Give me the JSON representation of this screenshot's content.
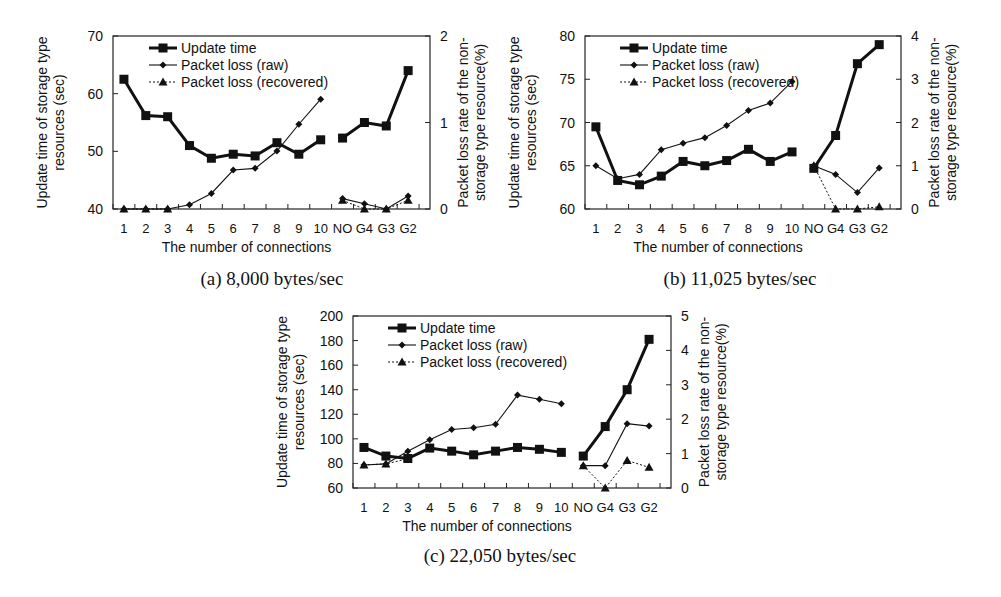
{
  "figure": {
    "panels": [
      {
        "id": "a",
        "caption": "(a) 8,000 bytes/sec"
      },
      {
        "id": "b",
        "caption": "(b) 11,025 bytes/sec"
      },
      {
        "id": "c",
        "caption": "(c) 22,050 bytes/sec"
      }
    ]
  },
  "chart_data": [
    {
      "type": "line",
      "title": "(a) 8,000 bytes/sec",
      "xlabel": "The number of connections",
      "ylabel": "Update time of storage type resources (sec)",
      "y2label": "Packet loss rate of the non-storage type resource(%)",
      "categories": [
        "1",
        "2",
        "3",
        "4",
        "5",
        "6",
        "7",
        "8",
        "9",
        "10",
        "NO",
        "G4",
        "G3",
        "G2"
      ],
      "ylim": [
        40,
        70
      ],
      "yticks": [
        40,
        50,
        60,
        70
      ],
      "y2lim": [
        0,
        2
      ],
      "y2ticks": [
        0,
        1,
        2
      ],
      "grid": false,
      "legend": {
        "position": "upper-left",
        "entries": [
          "Update time",
          "Packet loss (raw)",
          "Packet loss (recovered)"
        ]
      },
      "series": [
        {
          "name": "Update time",
          "axis": "left",
          "style": "bold-square",
          "values": [
            62.5,
            56.2,
            56.0,
            51.0,
            48.8,
            49.5,
            49.2,
            51.5,
            49.5,
            52.0,
            52.3,
            55.0,
            54.4,
            64.0
          ]
        },
        {
          "name": "Packet loss (raw)",
          "axis": "right",
          "style": "thin-diamond",
          "values": [
            0,
            0,
            0,
            0.05,
            0.18,
            0.45,
            0.47,
            0.67,
            0.98,
            1.27,
            0.12,
            0.06,
            0.0,
            0.15
          ]
        },
        {
          "name": "Packet loss (recovered)",
          "axis": "right",
          "style": "dotted-triangle",
          "values": [
            0,
            0,
            0,
            null,
            null,
            null,
            null,
            null,
            null,
            null,
            0.1,
            0.0,
            0.0,
            0.1
          ]
        }
      ]
    },
    {
      "type": "line",
      "title": "(b) 11,025 bytes/sec",
      "xlabel": "The number of connections",
      "ylabel": "Update time of storage type resources (sec)",
      "y2label": "Packet loss rate of the non-storage type resource(%)",
      "categories": [
        "1",
        "2",
        "3",
        "4",
        "5",
        "6",
        "7",
        "8",
        "9",
        "10",
        "NO",
        "G4",
        "G3",
        "G2"
      ],
      "ylim": [
        60,
        80
      ],
      "yticks": [
        60,
        65,
        70,
        75,
        80
      ],
      "y2lim": [
        0,
        4
      ],
      "y2ticks": [
        0,
        1,
        2,
        3,
        4
      ],
      "grid": false,
      "legend": {
        "position": "upper-left",
        "entries": [
          "Update time",
          "Packet loss (raw)",
          "Packet loss (recovered)"
        ]
      },
      "series": [
        {
          "name": "Update time",
          "axis": "left",
          "style": "bold-square",
          "values": [
            69.5,
            63.3,
            62.8,
            63.8,
            65.5,
            65.0,
            65.6,
            66.9,
            65.5,
            66.6,
            64.7,
            68.5,
            76.8,
            79.0
          ]
        },
        {
          "name": "Packet loss (raw)",
          "axis": "right",
          "style": "thin-diamond",
          "values": [
            1.0,
            0.7,
            0.8,
            1.37,
            1.52,
            1.65,
            1.93,
            2.28,
            2.45,
            2.95,
            1.0,
            0.8,
            0.38,
            0.95
          ]
        },
        {
          "name": "Packet loss (recovered)",
          "axis": "right",
          "style": "dotted-triangle",
          "values": [
            null,
            null,
            null,
            null,
            null,
            null,
            null,
            null,
            null,
            null,
            1.0,
            0.0,
            0.0,
            0.05
          ]
        }
      ]
    },
    {
      "type": "line",
      "title": "(c) 22,050 bytes/sec",
      "xlabel": "The number of connections",
      "ylabel": "Update time of storage type resources (sec)",
      "y2label": "Packet loss rate of the non-storage type resource(%)",
      "categories": [
        "1",
        "2",
        "3",
        "4",
        "5",
        "6",
        "7",
        "8",
        "9",
        "10",
        "NO",
        "G4",
        "G3",
        "G2"
      ],
      "ylim": [
        60,
        200
      ],
      "yticks": [
        60,
        80,
        100,
        120,
        140,
        160,
        180,
        200
      ],
      "y2lim": [
        0,
        5
      ],
      "y2ticks": [
        0,
        1,
        2,
        3,
        4,
        5
      ],
      "grid": false,
      "legend": {
        "position": "upper-left",
        "entries": [
          "Update time",
          "Packet loss (raw)",
          "Packet loss (recovered)"
        ]
      },
      "series": [
        {
          "name": "Update time",
          "axis": "left",
          "style": "bold-square",
          "values": [
            93,
            86,
            84,
            92.5,
            90,
            87,
            90,
            93,
            91.5,
            89,
            86,
            110,
            140,
            181
          ]
        },
        {
          "name": "Packet loss (raw)",
          "axis": "right",
          "style": "thin-diamond",
          "values": [
            0.67,
            0.7,
            1.07,
            1.4,
            1.7,
            1.75,
            1.85,
            2.7,
            2.58,
            2.45,
            0.65,
            0.65,
            1.87,
            1.8
          ]
        },
        {
          "name": "Packet loss (recovered)",
          "axis": "right",
          "style": "dotted-triangle",
          "values": [
            0.67,
            0.7,
            0.85,
            null,
            null,
            null,
            null,
            null,
            null,
            null,
            0.65,
            0.0,
            0.8,
            0.6
          ]
        }
      ]
    }
  ]
}
